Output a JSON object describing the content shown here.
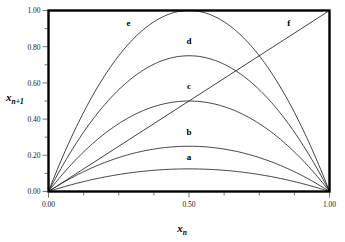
{
  "chart_data": {
    "type": "line",
    "title": "",
    "subtitle": "",
    "xlabel": "x_n",
    "xlabel_base": "x",
    "xlabel_sub": "n",
    "ylabel": "x_n+1",
    "ylabel_base": "x",
    "ylabel_sub": "n+1",
    "xlim": [
      0.0,
      1.0
    ],
    "ylim": [
      0.0,
      1.0
    ],
    "xticks": [
      0.0,
      0.5,
      1.0
    ],
    "xtick_labels": [
      "0.00",
      "0.50",
      "1.00"
    ],
    "yticks": [
      0.0,
      0.2,
      0.4,
      0.6,
      0.8,
      1.0
    ],
    "ytick_labels": [
      "0.00",
      "0.20",
      "0.40",
      "0.60",
      "0.80",
      "1.00"
    ],
    "x_minor_ticks": [
      0.125,
      0.25,
      0.375,
      0.625,
      0.75,
      0.875
    ],
    "y_minor_ticks": [
      0.1,
      0.3,
      0.5,
      0.7,
      0.9
    ],
    "grid": false,
    "legend_position": "inline-labels",
    "frame_color": "#000000",
    "curve_color": "#2b2b2b",
    "series": [
      {
        "name": "a",
        "label": "a",
        "equation": "x_{n+1} = 0.5 x_n (1 - x_n)",
        "r": 0.5,
        "peak": 0.125,
        "label_x": 0.5,
        "label_y": 0.175,
        "x": [
          0.0,
          0.05,
          0.1,
          0.15,
          0.2,
          0.25,
          0.3,
          0.35,
          0.4,
          0.45,
          0.5,
          0.55,
          0.6,
          0.65,
          0.7,
          0.75,
          0.8,
          0.85,
          0.9,
          0.95,
          1.0
        ],
        "values": [
          0.0,
          0.0238,
          0.045,
          0.0638,
          0.08,
          0.0938,
          0.105,
          0.1138,
          0.12,
          0.1238,
          0.125,
          0.1238,
          0.12,
          0.1138,
          0.105,
          0.0938,
          0.08,
          0.0638,
          0.045,
          0.0238,
          0.0
        ]
      },
      {
        "name": "b",
        "label": "b",
        "equation": "x_{n+1} = 1.0 x_n (1 - x_n)",
        "r": 1.0,
        "peak": 0.25,
        "label_x": 0.5,
        "label_y": 0.31,
        "x": [
          0.0,
          0.05,
          0.1,
          0.15,
          0.2,
          0.25,
          0.3,
          0.35,
          0.4,
          0.45,
          0.5,
          0.55,
          0.6,
          0.65,
          0.7,
          0.75,
          0.8,
          0.85,
          0.9,
          0.95,
          1.0
        ],
        "values": [
          0.0,
          0.0475,
          0.09,
          0.1275,
          0.16,
          0.1875,
          0.21,
          0.2275,
          0.24,
          0.2475,
          0.25,
          0.2475,
          0.24,
          0.2275,
          0.21,
          0.1875,
          0.16,
          0.1275,
          0.09,
          0.0475,
          0.0
        ]
      },
      {
        "name": "c",
        "label": "c",
        "equation": "x_{n+1} = 2.0 x_n (1 - x_n)",
        "r": 2.0,
        "peak": 0.5,
        "label_x": 0.5,
        "label_y": 0.565,
        "x": [
          0.0,
          0.05,
          0.1,
          0.15,
          0.2,
          0.25,
          0.3,
          0.35,
          0.4,
          0.45,
          0.5,
          0.55,
          0.6,
          0.65,
          0.7,
          0.75,
          0.8,
          0.85,
          0.9,
          0.95,
          1.0
        ],
        "values": [
          0.0,
          0.095,
          0.18,
          0.255,
          0.32,
          0.375,
          0.42,
          0.455,
          0.48,
          0.495,
          0.5,
          0.495,
          0.48,
          0.455,
          0.42,
          0.375,
          0.32,
          0.255,
          0.18,
          0.095,
          0.0
        ]
      },
      {
        "name": "d",
        "label": "d",
        "equation": "x_{n+1} = 3.0 x_n (1 - x_n)",
        "r": 3.0,
        "peak": 0.75,
        "label_x": 0.5,
        "label_y": 0.815,
        "x": [
          0.0,
          0.05,
          0.1,
          0.15,
          0.2,
          0.25,
          0.3,
          0.35,
          0.4,
          0.45,
          0.5,
          0.55,
          0.6,
          0.65,
          0.7,
          0.75,
          0.8,
          0.85,
          0.9,
          0.95,
          1.0
        ],
        "values": [
          0.0,
          0.1425,
          0.27,
          0.3825,
          0.48,
          0.5625,
          0.63,
          0.6825,
          0.72,
          0.7425,
          0.75,
          0.7425,
          0.72,
          0.6825,
          0.63,
          0.5625,
          0.48,
          0.3825,
          0.27,
          0.1425,
          0.0
        ]
      },
      {
        "name": "e",
        "label": "e",
        "equation": "x_{n+1} = 4.0 x_n (1 - x_n)",
        "r": 4.0,
        "peak": 1.0,
        "label_x": 0.285,
        "label_y": 0.915,
        "x": [
          0.0,
          0.05,
          0.1,
          0.15,
          0.2,
          0.25,
          0.3,
          0.35,
          0.4,
          0.45,
          0.5,
          0.55,
          0.6,
          0.65,
          0.7,
          0.75,
          0.8,
          0.85,
          0.9,
          0.95,
          1.0
        ],
        "values": [
          0.0,
          0.19,
          0.36,
          0.51,
          0.64,
          0.75,
          0.84,
          0.91,
          0.96,
          0.99,
          1.0,
          0.99,
          0.96,
          0.91,
          0.84,
          0.75,
          0.64,
          0.51,
          0.36,
          0.19,
          0.0
        ]
      },
      {
        "name": "f",
        "label": "f",
        "equation": "x_{n+1} = x_n",
        "r": null,
        "peak": 1.0,
        "label_x": 0.855,
        "label_y": 0.915,
        "x": [
          0.0,
          1.0
        ],
        "values": [
          0.0,
          1.0
        ]
      }
    ]
  }
}
